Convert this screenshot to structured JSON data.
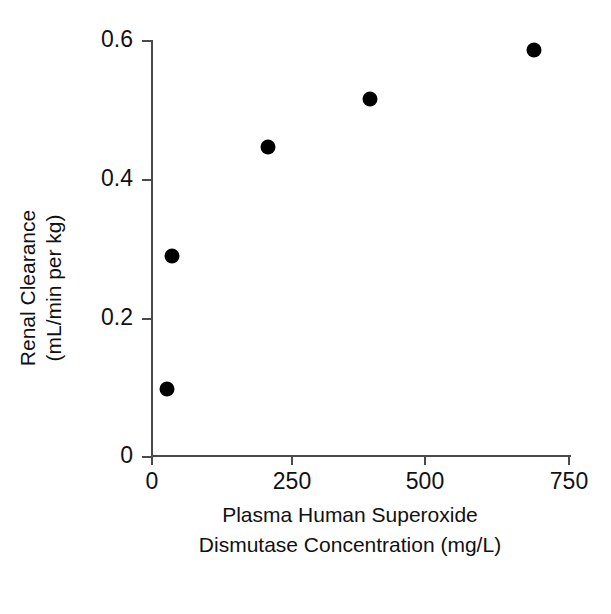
{
  "chart_data": {
    "type": "scatter",
    "title": "",
    "subtitle": "",
    "xlabel_lines": [
      "Plasma Human Superoxide",
      "Dismutase Concentration (mg/L)"
    ],
    "ylabel_lines": [
      "Renal Clearance",
      "(mL/min per kg)"
    ],
    "xlabel": "Plasma Human Superoxide Dismutase Concentration (mg/L)",
    "ylabel": "Renal Clearance (mL/min per kg)",
    "xlim": [
      0,
      750
    ],
    "ylim": [
      0,
      0.6
    ],
    "xticks": [
      0,
      250,
      500,
      750
    ],
    "xtick_labels": [
      "0",
      "250",
      "500",
      "750"
    ],
    "yticks": [
      0,
      0.2,
      0.4,
      0.6
    ],
    "ytick_labels": [
      "0",
      "0.2",
      "0.4",
      "0.6"
    ],
    "grid": false,
    "legend": false,
    "legend_position": "none",
    "marker": "filled-circle",
    "marker_color": "#000000",
    "axis_color": "#4a4a4a",
    "background_color": "#ffffff",
    "points": [
      {
        "x": 27,
        "y": 0.097
      },
      {
        "x": 37,
        "y": 0.288
      },
      {
        "x": 212,
        "y": 0.446
      },
      {
        "x": 400,
        "y": 0.515
      },
      {
        "x": 700,
        "y": 0.586
      }
    ],
    "series": [
      {
        "name": "Renal clearance vs plasma hSOD concentration",
        "x": [
          27,
          37,
          212,
          400,
          700
        ],
        "values": [
          0.097,
          0.288,
          0.446,
          0.515,
          0.586
        ]
      }
    ]
  }
}
